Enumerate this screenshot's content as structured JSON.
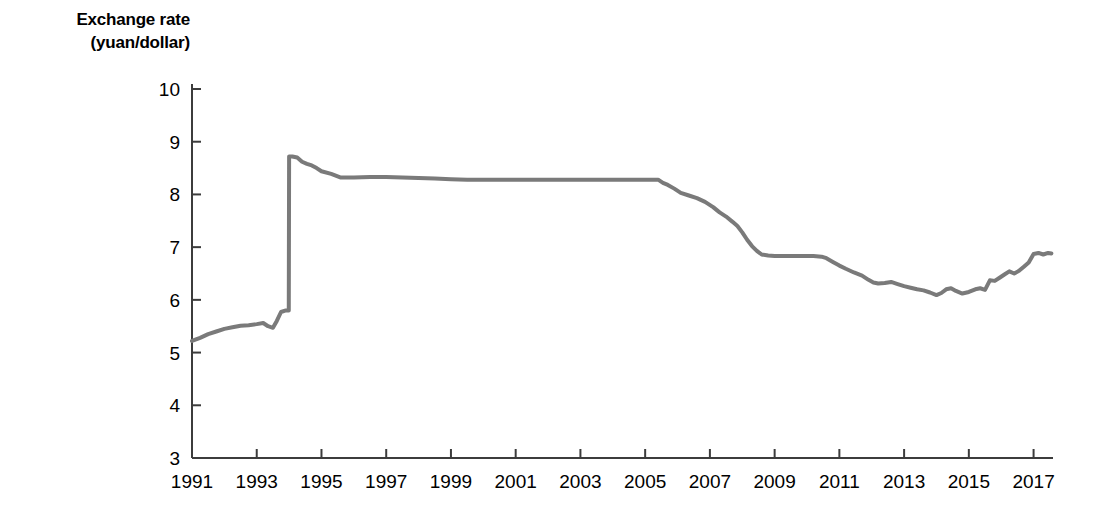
{
  "chart_data": {
    "type": "line",
    "title": "Exchange rate (yuan/dollar)",
    "title_line1": "Exchange rate",
    "title_line2": "(yuan/dollar)",
    "xlabel": "",
    "ylabel": "Exchange rate (yuan/dollar)",
    "xlim": [
      1991,
      2017.6
    ],
    "ylim": [
      3,
      10
    ],
    "xticks": [
      1991,
      1993,
      1995,
      1997,
      1999,
      2001,
      2003,
      2005,
      2007,
      2009,
      2011,
      2013,
      2015,
      2017
    ],
    "xtick_labels": [
      "1991",
      "1993",
      "1995",
      "1997",
      "1999",
      "2001",
      "2003",
      "2005",
      "2007",
      "2009",
      "2011",
      "2013",
      "2015",
      "2017"
    ],
    "yticks": [
      3,
      4,
      5,
      6,
      7,
      8,
      9,
      10
    ],
    "ytick_labels": [
      "3",
      "4",
      "5",
      "6",
      "7",
      "8",
      "9",
      "10"
    ],
    "grid": false,
    "legend": false,
    "line_color": "#7a7a7a",
    "line_width": 4,
    "axis_color": "#3c3c3c",
    "background": "#ffffff",
    "series": [
      {
        "name": "Exchange rate (yuan/dollar)",
        "x": [
          1991.0,
          1991.25,
          1991.5,
          1991.75,
          1992.0,
          1992.25,
          1992.5,
          1992.75,
          1993.0,
          1993.2,
          1993.35,
          1993.5,
          1993.62,
          1993.75,
          1993.9,
          1993.99,
          1994.0,
          1994.1,
          1994.25,
          1994.4,
          1994.55,
          1994.7,
          1994.85,
          1995.0,
          1995.3,
          1995.6,
          1996.0,
          1996.5,
          1997.0,
          1997.5,
          1998.0,
          1998.5,
          1999.0,
          1999.5,
          2000.0,
          2000.5,
          2001.0,
          2001.5,
          2002.0,
          2002.5,
          2003.0,
          2003.5,
          2004.0,
          2004.5,
          2005.0,
          2005.4,
          2005.55,
          2005.7,
          2005.9,
          2006.1,
          2006.35,
          2006.6,
          2006.85,
          2007.1,
          2007.3,
          2007.5,
          2007.7,
          2007.85,
          2008.0,
          2008.15,
          2008.3,
          2008.45,
          2008.6,
          2008.8,
          2009.0,
          2009.4,
          2009.8,
          2010.2,
          2010.45,
          2010.6,
          2010.8,
          2011.0,
          2011.2,
          2011.45,
          2011.7,
          2011.9,
          2012.05,
          2012.2,
          2012.4,
          2012.6,
          2012.8,
          2013.0,
          2013.2,
          2013.4,
          2013.6,
          2013.8,
          2014.0,
          2014.15,
          2014.3,
          2014.45,
          2014.6,
          2014.8,
          2015.0,
          2015.2,
          2015.35,
          2015.5,
          2015.65,
          2015.8,
          2015.95,
          2016.1,
          2016.25,
          2016.4,
          2016.55,
          2016.7,
          2016.85,
          2017.0,
          2017.15,
          2017.3,
          2017.45,
          2017.55
        ],
        "y": [
          5.22,
          5.28,
          5.35,
          5.4,
          5.45,
          5.48,
          5.51,
          5.52,
          5.54,
          5.56,
          5.5,
          5.47,
          5.6,
          5.77,
          5.8,
          5.8,
          8.72,
          8.72,
          8.7,
          8.62,
          8.58,
          8.55,
          8.5,
          8.44,
          8.39,
          8.32,
          8.32,
          8.33,
          8.33,
          8.32,
          8.31,
          8.3,
          8.29,
          8.28,
          8.28,
          8.28,
          8.28,
          8.28,
          8.28,
          8.28,
          8.28,
          8.28,
          8.28,
          8.28,
          8.28,
          8.28,
          8.22,
          8.18,
          8.11,
          8.03,
          7.98,
          7.93,
          7.86,
          7.76,
          7.66,
          7.58,
          7.48,
          7.4,
          7.28,
          7.14,
          7.02,
          6.93,
          6.86,
          6.84,
          6.83,
          6.83,
          6.83,
          6.83,
          6.82,
          6.79,
          6.72,
          6.65,
          6.59,
          6.52,
          6.46,
          6.38,
          6.33,
          6.31,
          6.32,
          6.34,
          6.3,
          6.26,
          6.23,
          6.2,
          6.18,
          6.14,
          6.09,
          6.13,
          6.2,
          6.22,
          6.17,
          6.12,
          6.15,
          6.2,
          6.22,
          6.19,
          6.37,
          6.36,
          6.42,
          6.48,
          6.54,
          6.5,
          6.55,
          6.63,
          6.71,
          6.87,
          6.89,
          6.86,
          6.89,
          6.88
        ]
      }
    ]
  },
  "layout": {
    "plot_left": 192,
    "plot_right": 1053,
    "plot_top": 89,
    "plot_bottom": 458
  }
}
